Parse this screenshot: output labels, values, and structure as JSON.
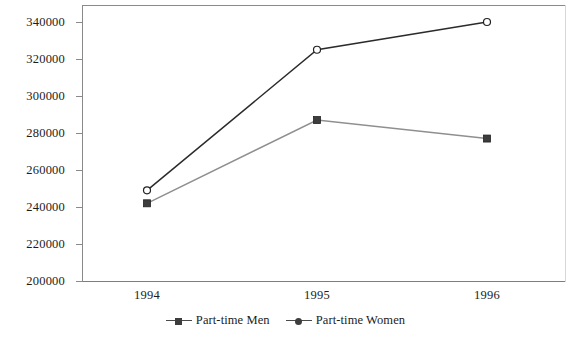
{
  "chart_data": {
    "type": "line",
    "title": "",
    "subtitle": "",
    "xlabel": "",
    "ylabel": "",
    "categories": [
      "1994",
      "1995",
      "1996"
    ],
    "x_tick_labels": [
      "1994",
      "1995",
      "1996"
    ],
    "y_tick_labels": [
      "200000",
      "220000",
      "240000",
      "260000",
      "280000",
      "300000",
      "320000",
      "340000"
    ],
    "y_tick_values": [
      200000,
      220000,
      240000,
      260000,
      280000,
      300000,
      320000,
      340000
    ],
    "ylim": [
      200000,
      345000
    ],
    "grid": false,
    "legend_position": "bottom-center",
    "series": [
      {
        "name": "Part-time Men",
        "marker": "square",
        "color": "#3d3d3d",
        "values": [
          242000,
          287000,
          277000
        ]
      },
      {
        "name": "Part-time Women",
        "marker": "circle",
        "color": "#2b2b2b",
        "values": [
          249000,
          325000,
          340000
        ]
      }
    ]
  },
  "legend": {
    "entries": [
      {
        "label": "Part-time Men",
        "marker": "square-marker-icon"
      },
      {
        "label": "Part-time Women",
        "marker": "circle-marker-icon"
      }
    ]
  },
  "colors": {
    "men_line": "#8f8f8f",
    "women_line": "#2b2b2b",
    "axis": "#8a8a8a",
    "text": "#1c1c1c",
    "background": "#ffffff"
  }
}
